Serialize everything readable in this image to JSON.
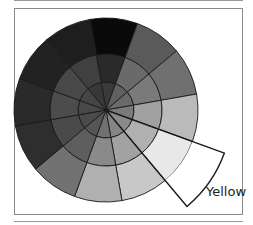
{
  "figure": {
    "center": [
      106,
      110
    ],
    "radii": {
      "inner": 28,
      "middle": 56,
      "outer": 92,
      "highlight": 126
    },
    "start_angle_deg": -100,
    "wedge_span_deg": 30,
    "stroke": "#1a1a1a",
    "wedges": [
      {
        "name": "wedge-1",
        "colors": [
          "#3a3a3a",
          "#2a2a2a",
          "#0a0a0a"
        ]
      },
      {
        "name": "wedge-2",
        "colors": [
          "#606060",
          "#6a6a6a",
          "#5a5a5a"
        ]
      },
      {
        "name": "wedge-3",
        "colors": [
          "#6a6a6a",
          "#7a7a7a",
          "#707070"
        ]
      },
      {
        "name": "wedge-4",
        "colors": [
          "#7a7a7a",
          "#a0a0a0",
          "#bababa"
        ]
      },
      {
        "name": "wedge-yellow",
        "colors": [
          "#8a8a8a",
          "#b0b0b0",
          "#e8e8e8"
        ],
        "highlighted": true
      },
      {
        "name": "wedge-6",
        "colors": [
          "#858585",
          "#a2a2a2",
          "#c8c8c8"
        ]
      },
      {
        "name": "wedge-7",
        "colors": [
          "#707070",
          "#8a8a8a",
          "#b0b0b0"
        ]
      },
      {
        "name": "wedge-8",
        "colors": [
          "#555555",
          "#5e5e5e",
          "#727272"
        ]
      },
      {
        "name": "wedge-9",
        "colors": [
          "#4a4a4a",
          "#4a4a4a",
          "#2e2e2e"
        ]
      },
      {
        "name": "wedge-10",
        "colors": [
          "#484848",
          "#4c4c4c",
          "#2a2a2a"
        ]
      },
      {
        "name": "wedge-11",
        "colors": [
          "#454545",
          "#484848",
          "#222222"
        ]
      },
      {
        "name": "wedge-12",
        "colors": [
          "#383838",
          "#404040",
          "#1e1e1e"
        ]
      }
    ],
    "highlight_fill": "#ffffff"
  },
  "labels": {
    "highlighted_wedge": "Yellow"
  }
}
